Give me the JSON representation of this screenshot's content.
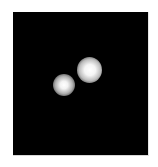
{
  "image": {
    "description": "Grayscale microscopy-style image: black square field with two bright blurred spots",
    "background_color": "#000000",
    "page_color": "#ffffff",
    "spots": [
      {
        "name": "lower-left spot",
        "center": [
          60,
          85
        ],
        "radius": 11
      },
      {
        "name": "upper-right spot",
        "center": [
          89,
          69
        ],
        "radius": 13
      }
    ]
  }
}
